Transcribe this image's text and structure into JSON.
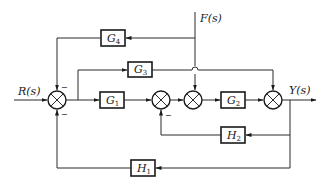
{
  "diagram": {
    "type": "control-system block diagram",
    "signals": {
      "input": {
        "name": "R",
        "arg": "(s)"
      },
      "disturbance": {
        "name": "F",
        "arg": "(s)"
      },
      "output": {
        "name": "Y",
        "arg": "(s)"
      }
    },
    "blocks": [
      {
        "id": "G1",
        "base": "G",
        "sub": "1"
      },
      {
        "id": "G2",
        "base": "G",
        "sub": "2"
      },
      {
        "id": "G3",
        "base": "G",
        "sub": "3"
      },
      {
        "id": "G4",
        "base": "G",
        "sub": "4"
      },
      {
        "id": "H1",
        "base": "H",
        "sub": "1"
      },
      {
        "id": "H2",
        "base": "H",
        "sub": "2"
      }
    ],
    "signs": {
      "sum1_top": "−",
      "sum1_bottom": "−",
      "sum2_bottom": "−"
    },
    "colors": {
      "line": "#2a2a2a",
      "background": "#ffffff"
    }
  }
}
